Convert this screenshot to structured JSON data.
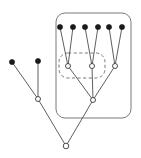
{
  "figure": {
    "width": 141,
    "height": 158,
    "background_color": "#ffffff"
  },
  "style": {
    "edge_color": "#4d4d4d",
    "edge_width": 0.9,
    "filled_node_color": "#1a1a1a",
    "open_node_fill": "#ffffff",
    "open_node_stroke": "#3a3a3a",
    "box_stroke_color": "#6b6b6b",
    "box_stroke_width": 0.9,
    "dash_pattern": "3.2 2.4"
  },
  "chart_data": {
    "type": "diagram",
    "diagram_kind": "rooted-tree-with-groups",
    "xlim": [
      0,
      141
    ],
    "ylim": [
      0,
      158
    ],
    "grid": false,
    "legend": null,
    "nodes": [
      {
        "id": "L1",
        "label": "",
        "x": 12,
        "y": 62,
        "kind": "leaf",
        "marker": "filled-circle",
        "radius": 2.6
      },
      {
        "id": "L2",
        "label": "",
        "x": 38,
        "y": 61,
        "kind": "leaf",
        "marker": "filled-circle",
        "radius": 2.6
      },
      {
        "id": "T1",
        "label": "",
        "x": 60,
        "y": 27,
        "kind": "leaf",
        "marker": "filled-circle",
        "radius": 2.6
      },
      {
        "id": "T2",
        "label": "",
        "x": 73,
        "y": 27,
        "kind": "leaf",
        "marker": "filled-circle",
        "radius": 2.6
      },
      {
        "id": "T3",
        "label": "",
        "x": 85,
        "y": 27,
        "kind": "leaf",
        "marker": "filled-circle",
        "radius": 2.6
      },
      {
        "id": "T4",
        "label": "",
        "x": 98,
        "y": 27,
        "kind": "leaf",
        "marker": "filled-circle",
        "radius": 2.6
      },
      {
        "id": "T5",
        "label": "",
        "x": 109,
        "y": 27,
        "kind": "leaf",
        "marker": "filled-circle",
        "radius": 2.6
      },
      {
        "id": "T6",
        "label": "",
        "x": 122,
        "y": 27,
        "kind": "leaf",
        "marker": "filled-circle",
        "radius": 2.6
      },
      {
        "id": "A",
        "label": "",
        "x": 68,
        "y": 66,
        "kind": "internal",
        "marker": "open-circle",
        "radius": 2.5
      },
      {
        "id": "B",
        "label": "",
        "x": 92,
        "y": 66,
        "kind": "internal",
        "marker": "open-circle",
        "radius": 2.5
      },
      {
        "id": "C",
        "label": "",
        "x": 115,
        "y": 66,
        "kind": "internal",
        "marker": "open-circle",
        "radius": 2.5
      },
      {
        "id": "M",
        "label": "",
        "x": 38,
        "y": 99,
        "kind": "internal",
        "marker": "open-circle",
        "radius": 2.5
      },
      {
        "id": "N",
        "label": "",
        "x": 93,
        "y": 100,
        "kind": "internal",
        "marker": "open-circle",
        "radius": 2.5
      },
      {
        "id": "R",
        "label": "",
        "x": 66,
        "y": 146,
        "kind": "root",
        "marker": "open-circle",
        "radius": 2.8
      }
    ],
    "edges": [
      {
        "from": "T1",
        "to": "A"
      },
      {
        "from": "T2",
        "to": "A"
      },
      {
        "from": "T3",
        "to": "B"
      },
      {
        "from": "T4",
        "to": "B"
      },
      {
        "from": "T5",
        "to": "C"
      },
      {
        "from": "T6",
        "to": "C"
      },
      {
        "from": "A",
        "to": "N"
      },
      {
        "from": "B",
        "to": "N"
      },
      {
        "from": "C",
        "to": "N"
      },
      {
        "from": "L1",
        "to": "M"
      },
      {
        "from": "L2",
        "to": "M"
      },
      {
        "from": "M",
        "to": "R"
      },
      {
        "from": "N",
        "to": "R"
      }
    ],
    "groups": [
      {
        "id": "outer-group",
        "style": "solid",
        "shape": "rounded-rect",
        "x": 56,
        "y": 13,
        "width": 75,
        "height": 105,
        "corner_radius": 9,
        "contains": [
          "T1",
          "T2",
          "T3",
          "T4",
          "T5",
          "T6",
          "A",
          "B",
          "C",
          "N"
        ]
      },
      {
        "id": "inner-group",
        "style": "dashed",
        "shape": "rounded-rect",
        "x": 59,
        "y": 53,
        "width": 46,
        "height": 25,
        "corner_radius": 9,
        "contains": [
          "A",
          "B"
        ]
      }
    ]
  }
}
